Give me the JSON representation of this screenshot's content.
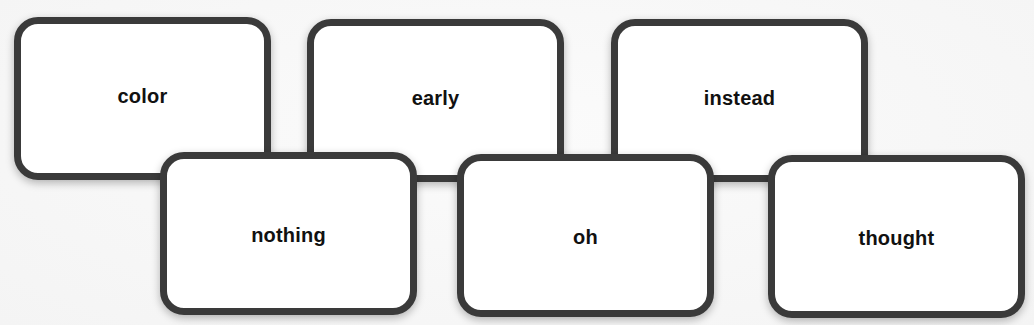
{
  "diagram": {
    "type": "word-cards",
    "colors": {
      "background": "#f7f7f7",
      "card_fill": "#ffffff",
      "card_border": "#3a3a3a",
      "text": "#111111"
    },
    "rows": {
      "top": [
        "color",
        "early",
        "instead"
      ],
      "bottom": [
        "nothing",
        "oh",
        "thought"
      ]
    },
    "cards": [
      {
        "label": "color",
        "row": "top",
        "left": 14,
        "top": 17
      },
      {
        "label": "early",
        "row": "top",
        "left": 307,
        "top": 19
      },
      {
        "label": "instead",
        "row": "top",
        "left": 611,
        "top": 19
      },
      {
        "label": "nothing",
        "row": "bottom",
        "left": 160,
        "top": 152
      },
      {
        "label": "oh",
        "row": "bottom",
        "left": 457,
        "top": 154
      },
      {
        "label": "thought",
        "row": "bottom",
        "left": 768,
        "top": 155
      }
    ]
  }
}
